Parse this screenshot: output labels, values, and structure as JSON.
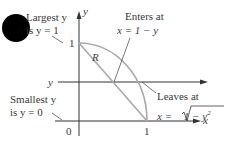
{
  "diagram": {
    "labels": {
      "largest_line1": "Largest y",
      "largest_line2": "is y = 1",
      "smallest_line1": "Smallest y",
      "smallest_line2": "is y = 0",
      "enters_line1": "Enters at",
      "enters_line2": "x = 1 − y",
      "leaves_line1": "Leaves at",
      "leaves_line2_prefix": "x = ",
      "leaves_line2_radicand": "1 − y",
      "leaves_line2_exp": "2",
      "region": "R",
      "y_axis": "y",
      "x_axis": "x",
      "y_line": "y",
      "tick_y1": "1",
      "tick_x1": "1",
      "origin": "0"
    },
    "colors": {
      "axis": "#333333",
      "curve": "#a8a8a8",
      "marker": "#000000",
      "text": "#3a3a3a"
    }
  }
}
